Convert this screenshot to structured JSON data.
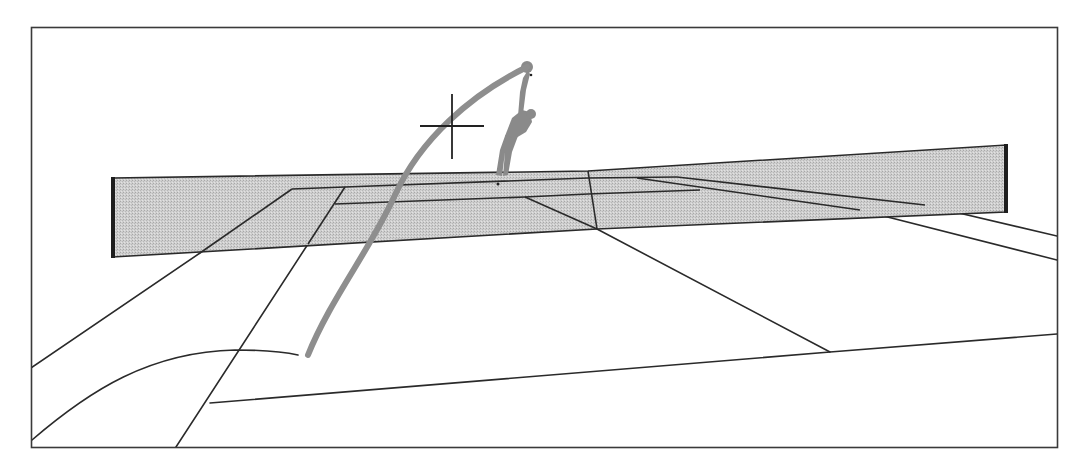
{
  "figure": {
    "description": "Perspective line drawing of a tennis court viewed from behind the baseline: a serving player beyond the net, the ball's curved trajectory coming toward the viewer, and a crosshair target marker",
    "colors": {
      "background": "#ffffff",
      "frame": "#3a3a3a",
      "court_lines": "#2a2a2a",
      "net_fill": "#c9c9c9",
      "net_posts": "#1e1e1e",
      "trajectory": "#8e8e8e",
      "player": "#8a8a8a",
      "crosshair": "#222222"
    },
    "elements": {
      "frame": "frame-border",
      "net": "net-band",
      "trajectory": "ball-trajectory",
      "player": "serving-player",
      "target": "crosshair-target"
    }
  }
}
